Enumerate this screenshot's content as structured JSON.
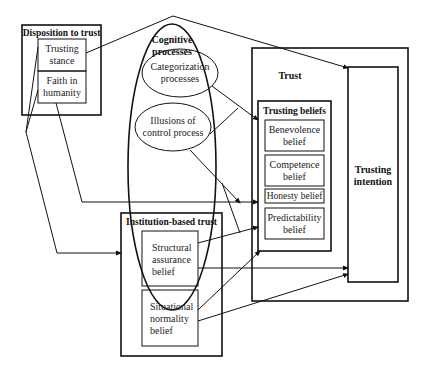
{
  "diagram": {
    "disposition": {
      "title": "Disposition to trust",
      "items": [
        "Trusting stance",
        "Faith in humanity"
      ],
      "trusting_stance_l1": "Trusting",
      "trusting_stance_l2": "stance",
      "faith_l1": "Faith in",
      "faith_l2": "humanity"
    },
    "cognitive": {
      "title_l1": "Cognitive",
      "title_l2": "processes",
      "categorization_l1": "Categorization",
      "categorization_l2": "processes",
      "illusions_l1": "Illusions of",
      "illusions_l2": "control process"
    },
    "trust": {
      "title": "Trust",
      "beliefs_title": "Trusting beliefs",
      "benevolence_l1": "Benevolence",
      "benevolence_l2": "belief",
      "competence_l1": "Competence",
      "competence_l2": "belief",
      "honesty": "Honesty belief",
      "predictability_l1": "Predictability",
      "predictability_l2": "belief",
      "intention_l1": "Trusting",
      "intention_l2": "intention"
    },
    "institution": {
      "title": "Institution-based trust",
      "structural_l1": "Structural",
      "structural_l2": "assurance",
      "structural_l3": "belief",
      "situational_l1": "Situational",
      "situational_l2": "normality",
      "situational_l3": "belief"
    },
    "colors": {
      "stroke": "#111111",
      "background": "#ffffff"
    }
  }
}
